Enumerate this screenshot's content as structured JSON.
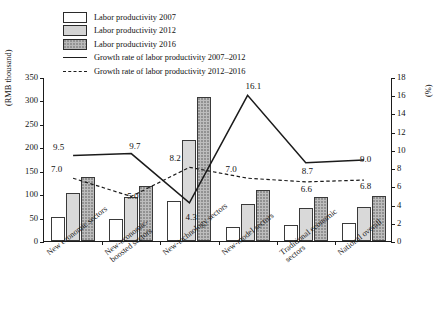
{
  "legend": {
    "items": [
      {
        "label": "Labor productivity 2007",
        "type": "bar",
        "key": "2007"
      },
      {
        "label": "Labor productivity 2012",
        "type": "bar",
        "key": "2012"
      },
      {
        "label": "Labor productivity 2016",
        "type": "bar",
        "key": "2016"
      },
      {
        "label": "Growth rate of labor productivity 2007–2012",
        "type": "line-solid"
      },
      {
        "label": "Growth rate of labor productivity 2012–2016",
        "type": "line-dashed"
      }
    ]
  },
  "axes": {
    "left_unit": "(RMB thousand)",
    "right_unit": "(%)",
    "left_ticks": [
      "0",
      "50",
      "100",
      "150",
      "200",
      "250",
      "300",
      "350"
    ],
    "right_ticks": [
      "0",
      "2",
      "4",
      "6",
      "8",
      "10",
      "12",
      "14",
      "16",
      "18"
    ]
  },
  "chart_data": {
    "type": "bar",
    "title": "",
    "xlabel": "",
    "ylabel": "(RMB thousand)",
    "y2label": "(%)",
    "ylim": [
      0,
      350
    ],
    "y2lim": [
      0,
      18
    ],
    "grid": false,
    "legend_position": "top-left",
    "categories": [
      "New economic sectors",
      "New-economic-\nboosted sectors",
      "New-technology sectors",
      "New-model sectors",
      "Traditional economic\nsectors",
      "National overall"
    ],
    "series": [
      {
        "name": "Labor productivity 2007",
        "axis": "left",
        "type": "bar",
        "values": [
          52,
          47,
          85,
          30,
          35,
          38
        ]
      },
      {
        "name": "Labor productivity 2012",
        "axis": "left",
        "type": "bar",
        "values": [
          103,
          95,
          215,
          80,
          70,
          72
        ]
      },
      {
        "name": "Labor productivity 2016",
        "axis": "left",
        "type": "bar",
        "values": [
          137,
          117,
          308,
          108,
          95,
          97
        ]
      },
      {
        "name": "Growth rate of labor productivity 2007–2012",
        "axis": "right",
        "type": "line",
        "style": "solid",
        "values": [
          9.5,
          9.7,
          4.3,
          16.1,
          8.7,
          9.0
        ]
      },
      {
        "name": "Growth rate of labor productivity 2012–2016",
        "axis": "right",
        "type": "line",
        "style": "dashed",
        "values": [
          7.0,
          5.0,
          8.2,
          7.0,
          6.6,
          6.8
        ]
      }
    ],
    "data_labels": {
      "solid": [
        "9.5",
        "9.7",
        "4.3",
        "16.1",
        "8.7",
        "9.0"
      ],
      "dashed": [
        "7.0",
        "5.0",
        "8.2",
        "7.0",
        "6.6",
        "6.8"
      ]
    }
  }
}
